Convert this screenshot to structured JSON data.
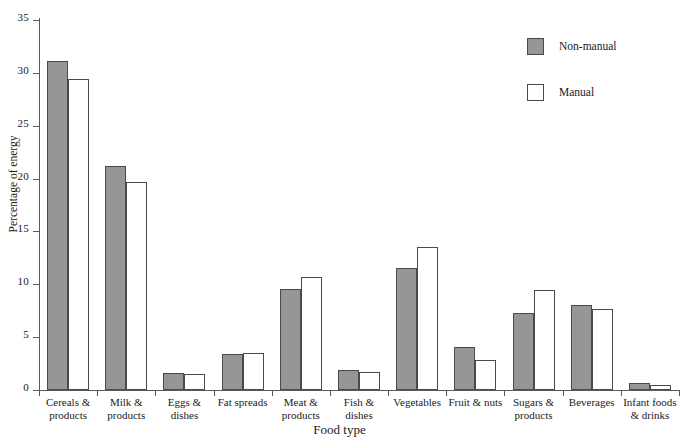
{
  "chart_data": {
    "type": "bar",
    "title": "",
    "xlabel": "Food type",
    "ylabel": "Percentage of energy",
    "ylim": [
      0,
      35
    ],
    "yticks": [
      0,
      5,
      10,
      15,
      20,
      25,
      30,
      35
    ],
    "grid": false,
    "legend_position": "top-right",
    "categories": [
      "Cereals & products",
      "Milk & products",
      "Eggs & dishes",
      "Fat spreads",
      "Meat & products",
      "Fish & dishes",
      "Vegetables",
      "Fruit & nuts",
      "Sugars & products",
      "Beverages",
      "Infant foods & drinks"
    ],
    "category_lines": [
      [
        "Cereals &",
        "products"
      ],
      [
        "Milk &",
        "products"
      ],
      [
        "Eggs &",
        "dishes"
      ],
      [
        "Fat spreads"
      ],
      [
        "Meat &",
        "products"
      ],
      [
        "Fish &",
        "dishes"
      ],
      [
        "Vegetables"
      ],
      [
        "Fruit & nuts"
      ],
      [
        "Sugars &",
        "products"
      ],
      [
        "Beverages"
      ],
      [
        "Infant foods",
        "& drinks"
      ]
    ],
    "series": [
      {
        "name": "Non-manual",
        "color": "#969696",
        "values": [
          31.1,
          21.2,
          1.6,
          3.4,
          9.6,
          1.9,
          11.5,
          4.1,
          7.3,
          8.0,
          0.7
        ]
      },
      {
        "name": "Manual",
        "color": "#ffffff",
        "values": [
          29.4,
          19.7,
          1.5,
          3.5,
          10.7,
          1.7,
          13.5,
          2.8,
          9.5,
          7.7,
          0.5
        ]
      }
    ]
  },
  "legend": {
    "items": [
      {
        "label": "Non-manual",
        "style": "filled"
      },
      {
        "label": "Manual",
        "style": "empty"
      }
    ]
  }
}
